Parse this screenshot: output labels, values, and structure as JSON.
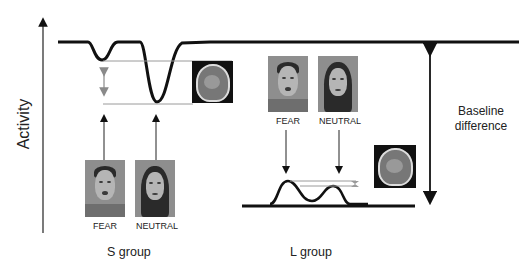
{
  "diagram": {
    "y_axis_label": "Activity",
    "groups": [
      {
        "name": "S group",
        "stimuli": [
          {
            "label": "FEAR",
            "image": "fearful-male-face"
          },
          {
            "label": "NEUTRAL",
            "image": "neutral-female-face"
          }
        ],
        "response": "large negative deflections from high baseline; NEUTRAL deeper than FEAR",
        "brain_image": "coronal-mri-slice"
      },
      {
        "name": "L group",
        "stimuli": [
          {
            "label": "FEAR",
            "image": "fearful-male-face"
          },
          {
            "label": "NEUTRAL",
            "image": "neutral-female-face"
          }
        ],
        "response": "small positive deflections from low baseline; FEAR slightly higher than NEUTRAL",
        "brain_image": "coronal-mri-slice"
      }
    ],
    "annotation": {
      "line1": "Baseline",
      "line2": "difference"
    },
    "colors": {
      "curve": "#111111",
      "guide_line": "#9a9a9a",
      "gray_arrow": "#8a8a8a",
      "text": "#222222"
    }
  }
}
